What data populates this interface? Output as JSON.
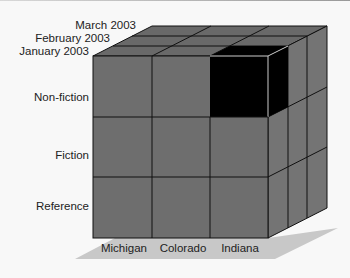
{
  "diagram": {
    "type": "olap-cube",
    "depth_labels": [
      "January 2003",
      "February 2003",
      "March 2003"
    ],
    "row_labels": [
      "Non-fiction",
      "Fiction",
      "Reference"
    ],
    "column_labels": [
      "Michigan",
      "Colorado",
      "Indiana"
    ],
    "highlighted_cell": {
      "row": "Non-fiction",
      "column": "Indiana",
      "depth": "January 2003"
    },
    "colors": {
      "face": "#6e6e6e",
      "top": "#696969",
      "side": "#747474",
      "highlight": "#000000",
      "grid": "#111111",
      "shadow": "#c8c8c8",
      "background": "#f8f8f8"
    }
  }
}
